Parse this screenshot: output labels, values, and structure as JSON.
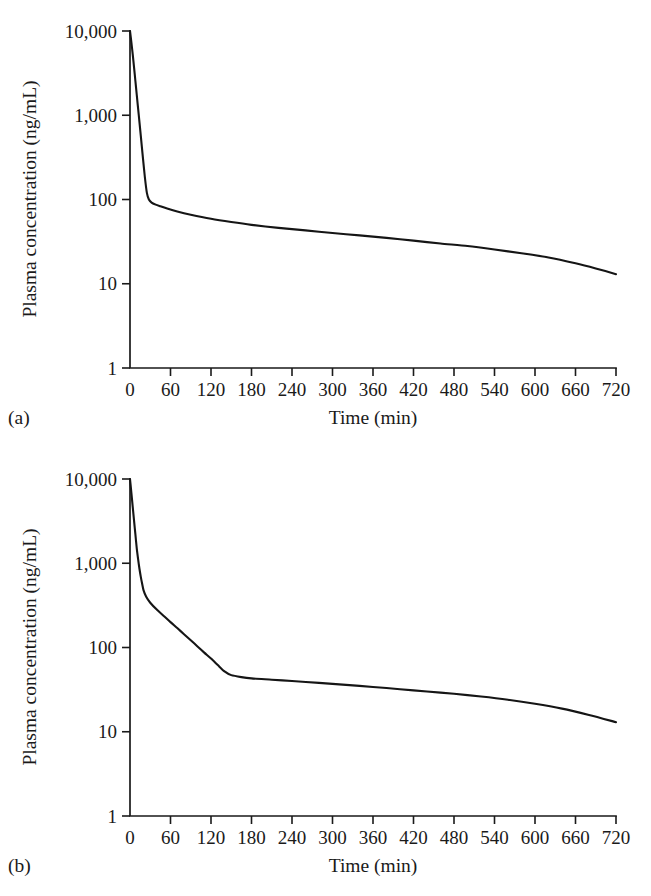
{
  "chart_data": [
    {
      "type": "line",
      "panel_tag": "(a)",
      "title": "",
      "xlabel": "Time (min)",
      "ylabel": "Plasma concentration (ng/mL)",
      "xlim": [
        0,
        720
      ],
      "ylim": [
        1,
        10000
      ],
      "yscale": "log",
      "xscale": "linear",
      "grid": false,
      "legend": false,
      "xticks": [
        0,
        60,
        120,
        180,
        240,
        300,
        360,
        420,
        480,
        540,
        600,
        660,
        720
      ],
      "xticklabels": [
        "0",
        "60",
        "120",
        "180",
        "240",
        "300",
        "360",
        "420",
        "480",
        "540",
        "600",
        "660",
        "720"
      ],
      "yticks": [
        1,
        10,
        100,
        1000,
        10000
      ],
      "yticklabels": [
        "1",
        "10",
        "100",
        "1,000",
        "10,000"
      ],
      "series": [
        {
          "name": "plasma concentration",
          "x": [
            0,
            2,
            4,
            6,
            8,
            10,
            13,
            16,
            19,
            22,
            25,
            28,
            32,
            38,
            45,
            55,
            70,
            90,
            120,
            150,
            180,
            220,
            260,
            300,
            340,
            380,
            420,
            460,
            500,
            540,
            580,
            620,
            660,
            690,
            720
          ],
          "values": [
            10000,
            7400,
            5300,
            3700,
            2550,
            1750,
            1000,
            570,
            320,
            185,
            120,
            100,
            92,
            87,
            83,
            78,
            72,
            66,
            59,
            54,
            50,
            46,
            43,
            40,
            37.5,
            35,
            32.5,
            30,
            28,
            25.5,
            23,
            20.5,
            17.5,
            15.2,
            13
          ]
        }
      ]
    },
    {
      "type": "line",
      "panel_tag": "(b)",
      "title": "",
      "xlabel": "Time (min)",
      "ylabel": "Plasma concentration (ng/mL)",
      "xlim": [
        0,
        720
      ],
      "ylim": [
        1,
        10000
      ],
      "yscale": "log",
      "xscale": "linear",
      "grid": false,
      "legend": false,
      "xticks": [
        0,
        60,
        120,
        180,
        240,
        300,
        360,
        420,
        480,
        540,
        600,
        660,
        720
      ],
      "xticklabels": [
        "0",
        "60",
        "120",
        "180",
        "240",
        "300",
        "360",
        "420",
        "480",
        "540",
        "600",
        "660",
        "720"
      ],
      "yticks": [
        1,
        10,
        100,
        1000,
        10000
      ],
      "yticklabels": [
        "1",
        "10",
        "100",
        "1,000",
        "10,000"
      ],
      "series": [
        {
          "name": "plasma concentration",
          "x": [
            0,
            2,
            4,
            6,
            8,
            10,
            12,
            14,
            16,
            18,
            20,
            24,
            30,
            40,
            50,
            60,
            70,
            80,
            90,
            100,
            110,
            120,
            130,
            140,
            150,
            165,
            180,
            210,
            240,
            280,
            320,
            360,
            400,
            440,
            480,
            520,
            560,
            600,
            640,
            680,
            720
          ],
          "values": [
            10000,
            6900,
            4700,
            3200,
            2200,
            1500,
            1120,
            860,
            690,
            570,
            480,
            400,
            340,
            280,
            237,
            200,
            170,
            144,
            122,
            103,
            87,
            74,
            62,
            52,
            47,
            44.5,
            43,
            41.5,
            40,
            38,
            36,
            34,
            32,
            30,
            28.2,
            26.2,
            24,
            21.5,
            18.8,
            15.8,
            13
          ]
        }
      ]
    }
  ]
}
